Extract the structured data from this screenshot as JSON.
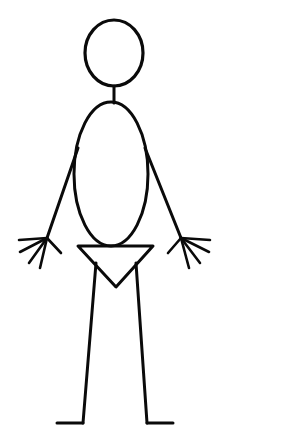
{
  "image": {
    "title": "Stick Figure",
    "subject": "stick-figure-person",
    "width": 282,
    "height": 434,
    "background_color": "#ffffff",
    "stroke_color": "#0a0a0a",
    "style": "black line drawing on white background",
    "orientation": "front-facing, arms spread downward and outward, legs apart"
  },
  "figure": {
    "head": {
      "label": "head",
      "shape": "ellipse",
      "cx": 114,
      "cy": 53,
      "rx": 29,
      "ry": 33,
      "stroke_width": 3.2
    },
    "neck": {
      "label": "neck",
      "shape": "line",
      "x1": 114,
      "y1": 86,
      "x2": 114,
      "y2": 103,
      "stroke_width": 3.0
    },
    "torso": {
      "label": "torso",
      "shape": "ellipse",
      "cx": 111,
      "cy": 174,
      "rx": 37,
      "ry": 72,
      "stroke_width": 3.0
    },
    "arms": [
      {
        "label": "left-arm",
        "shape": "line",
        "x1": 78,
        "y1": 148,
        "x2": 47,
        "y2": 238,
        "stroke_width": 3.0
      },
      {
        "label": "right-arm",
        "shape": "line",
        "x1": 145,
        "y1": 148,
        "x2": 181,
        "y2": 238,
        "stroke_width": 3.0
      }
    ],
    "hands": [
      {
        "label": "left-hand",
        "wrist_x": 47,
        "wrist_y": 238,
        "finger_count": 5,
        "fingers": [
          {
            "x": 19,
            "y": 240
          },
          {
            "x": 20,
            "y": 252
          },
          {
            "x": 29,
            "y": 263
          },
          {
            "x": 40,
            "y": 268
          },
          {
            "x": 61,
            "y": 253
          }
        ],
        "stroke_width": 2.6
      },
      {
        "label": "right-hand",
        "wrist_x": 181,
        "wrist_y": 238,
        "finger_count": 5,
        "fingers": [
          {
            "x": 210,
            "y": 240
          },
          {
            "x": 209,
            "y": 252
          },
          {
            "x": 200,
            "y": 263
          },
          {
            "x": 189,
            "y": 268
          },
          {
            "x": 168,
            "y": 253
          }
        ],
        "stroke_width": 2.6
      }
    ],
    "hips": {
      "label": "hips-triangle",
      "shape": "polygon",
      "points": "78,246 153,246 116,287",
      "stroke_width": 3.0
    },
    "legs": [
      {
        "label": "left-leg",
        "shape": "line",
        "x1": 96,
        "y1": 263,
        "x2": 83,
        "y2": 423,
        "stroke_width": 3.0
      },
      {
        "label": "right-leg",
        "shape": "line",
        "x1": 136,
        "y1": 263,
        "x2": 147,
        "y2": 423,
        "stroke_width": 3.0
      }
    ],
    "feet": [
      {
        "label": "left-foot",
        "shape": "line",
        "x1": 83,
        "y1": 423,
        "x2": 57,
        "y2": 423,
        "stroke_width": 3.0
      },
      {
        "label": "right-foot",
        "shape": "line",
        "x1": 147,
        "y1": 423,
        "x2": 173,
        "y2": 423,
        "stroke_width": 3.0
      }
    ]
  }
}
